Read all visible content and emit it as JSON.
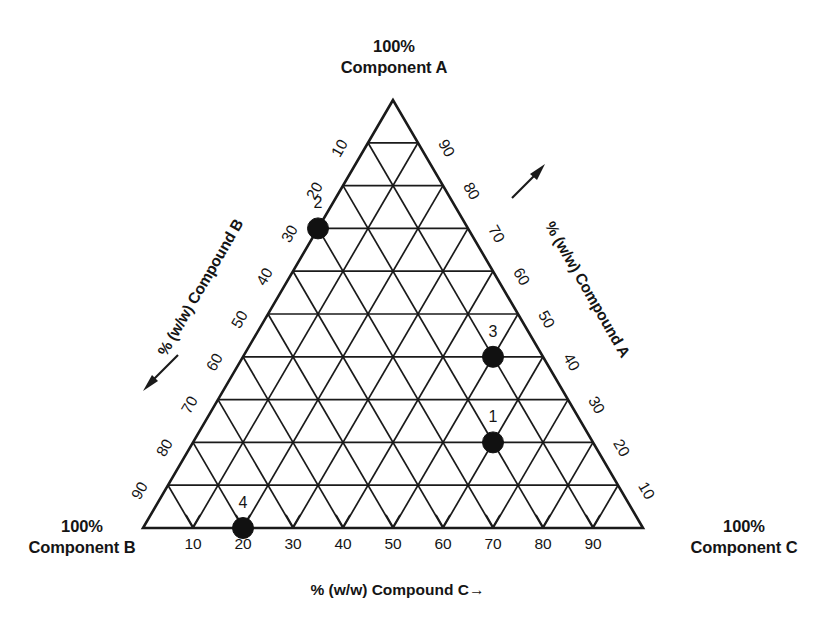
{
  "figure": {
    "title_vertices": {
      "apex": {
        "value": "100%",
        "name": "Component A"
      },
      "bottom_left": {
        "value": "100%",
        "name": "Component B"
      },
      "bottom_right": {
        "value": "100%",
        "name": "Component C"
      }
    },
    "axis_labels": {
      "bottom": "% (w/w) Compound C",
      "bottom_arrow": "→",
      "left": "% (w/w) Compound B",
      "left_arrow": "←",
      "right": "% (w/w) Compound A",
      "right_arrow": "↑"
    },
    "colors": {
      "line": "#1a1a1a",
      "text": "#151515",
      "marker": "#111111",
      "background": "#ffffff"
    }
  },
  "chart_data": {
    "type": "scatter",
    "plot_kind": "ternary-phase-diagram",
    "title": "",
    "axes": [
      {
        "id": "A",
        "label": "% (w/w) Compound A",
        "vertex_label": "100% Component A",
        "side": "right",
        "ticks": [
          10,
          20,
          30,
          40,
          50,
          60,
          70,
          80,
          90
        ],
        "range": [
          0,
          100
        ],
        "direction_arrow": "up"
      },
      {
        "id": "B",
        "label": "% (w/w) Compound B",
        "vertex_label": "100% Component B",
        "side": "left",
        "ticks": [
          10,
          20,
          30,
          40,
          50,
          60,
          70,
          80,
          90
        ],
        "range": [
          0,
          100
        ],
        "direction_arrow": "down-left"
      },
      {
        "id": "C",
        "label": "% (w/w) Compound C",
        "vertex_label": "100% Component C",
        "side": "bottom",
        "ticks": [
          10,
          20,
          30,
          40,
          50,
          60,
          70,
          80,
          90
        ],
        "range": [
          0,
          100
        ],
        "direction_arrow": "right"
      }
    ],
    "grid": {
      "on": true,
      "divisions": 10,
      "step": 10
    },
    "legend": {
      "position": "none",
      "entries": []
    },
    "points": [
      {
        "label": "1",
        "A": 20,
        "B": 20,
        "C": 60
      },
      {
        "label": "2",
        "A": 70,
        "B": 30,
        "C": 0
      },
      {
        "label": "3",
        "A": 40,
        "B": 10,
        "C": 50
      },
      {
        "label": "4",
        "A": 0,
        "B": 80,
        "C": 20
      }
    ],
    "point_label_offset": {
      "dx": 0,
      "dy": -14
    }
  }
}
